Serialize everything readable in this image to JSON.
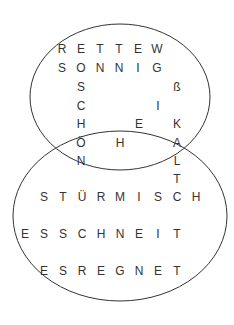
{
  "puzzle": {
    "type": "word-grid-venn",
    "ellipses": [
      {
        "name": "top-ellipse",
        "cx": 120,
        "cy": 97,
        "rx": 90,
        "ry": 73
      },
      {
        "name": "bottom-ellipse",
        "cx": 120,
        "cy": 216,
        "rx": 107,
        "ry": 85
      }
    ],
    "stroke_color": "#333333",
    "letters": [
      {
        "c": "R",
        "x": 62,
        "y": 49
      },
      {
        "c": "E",
        "x": 81,
        "y": 49
      },
      {
        "c": "T",
        "x": 100,
        "y": 49
      },
      {
        "c": "T",
        "x": 119,
        "y": 49
      },
      {
        "c": "E",
        "x": 138,
        "y": 49
      },
      {
        "c": "W",
        "x": 157,
        "y": 49
      },
      {
        "c": "S",
        "x": 62,
        "y": 68
      },
      {
        "c": "O",
        "x": 81,
        "y": 68
      },
      {
        "c": "N",
        "x": 100,
        "y": 68
      },
      {
        "c": "N",
        "x": 119,
        "y": 68
      },
      {
        "c": "I",
        "x": 138,
        "y": 68
      },
      {
        "c": "G",
        "x": 157,
        "y": 68
      },
      {
        "c": "S",
        "x": 81,
        "y": 87
      },
      {
        "c": "ß",
        "x": 177,
        "y": 87
      },
      {
        "c": "C",
        "x": 81,
        "y": 106
      },
      {
        "c": "I",
        "x": 158,
        "y": 106
      },
      {
        "c": "H",
        "x": 81,
        "y": 124
      },
      {
        "c": "E",
        "x": 139,
        "y": 124
      },
      {
        "c": "K",
        "x": 177,
        "y": 124
      },
      {
        "c": "Ö",
        "x": 81,
        "y": 143
      },
      {
        "c": "H",
        "x": 120,
        "y": 143
      },
      {
        "c": "A",
        "x": 177,
        "y": 143
      },
      {
        "c": "N",
        "x": 81,
        "y": 161
      },
      {
        "c": "L",
        "x": 177,
        "y": 161
      },
      {
        "c": "T",
        "x": 177,
        "y": 179
      },
      {
        "c": "S",
        "x": 44,
        "y": 197
      },
      {
        "c": "T",
        "x": 63,
        "y": 197
      },
      {
        "c": "Ü",
        "x": 82,
        "y": 197
      },
      {
        "c": "R",
        "x": 101,
        "y": 197
      },
      {
        "c": "M",
        "x": 120,
        "y": 197
      },
      {
        "c": "I",
        "x": 139,
        "y": 197
      },
      {
        "c": "S",
        "x": 158,
        "y": 197
      },
      {
        "c": "C",
        "x": 177,
        "y": 197
      },
      {
        "c": "H",
        "x": 196,
        "y": 197
      },
      {
        "c": "E",
        "x": 25,
        "y": 234
      },
      {
        "c": "S",
        "x": 44,
        "y": 234
      },
      {
        "c": "S",
        "x": 63,
        "y": 234
      },
      {
        "c": "C",
        "x": 82,
        "y": 234
      },
      {
        "c": "H",
        "x": 101,
        "y": 234
      },
      {
        "c": "N",
        "x": 120,
        "y": 234
      },
      {
        "c": "E",
        "x": 139,
        "y": 234
      },
      {
        "c": "I",
        "x": 158,
        "y": 234
      },
      {
        "c": "T",
        "x": 177,
        "y": 234
      },
      {
        "c": "E",
        "x": 44,
        "y": 271
      },
      {
        "c": "S",
        "x": 63,
        "y": 271
      },
      {
        "c": "R",
        "x": 82,
        "y": 271
      },
      {
        "c": "E",
        "x": 101,
        "y": 271
      },
      {
        "c": "G",
        "x": 120,
        "y": 271
      },
      {
        "c": "N",
        "x": 139,
        "y": 271
      },
      {
        "c": "E",
        "x": 158,
        "y": 271
      },
      {
        "c": "T",
        "x": 177,
        "y": 271
      }
    ]
  }
}
